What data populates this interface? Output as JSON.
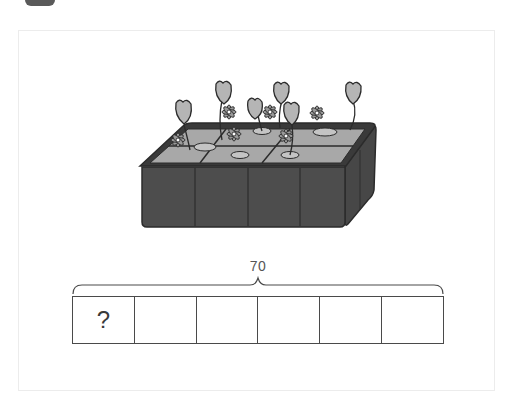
{
  "problem": {
    "total_label": "70",
    "parts_count": 6,
    "cells": [
      {
        "label": "?"
      },
      {
        "label": ""
      },
      {
        "label": ""
      },
      {
        "label": ""
      },
      {
        "label": ""
      },
      {
        "label": ""
      }
    ]
  },
  "illustration": {
    "subject": "planter box with six compartments of flowers",
    "compartments": 6,
    "colors": {
      "box_dark": "#4d4d4d",
      "box_top": "#a8a8a8",
      "outline": "#2b2b2b",
      "flower_fill": "#b5b5b5"
    }
  },
  "colors": {
    "frame_border": "#ececec",
    "line": "#4a4a4a",
    "text": "#555555",
    "corner_tab": "#5a5a5a"
  }
}
